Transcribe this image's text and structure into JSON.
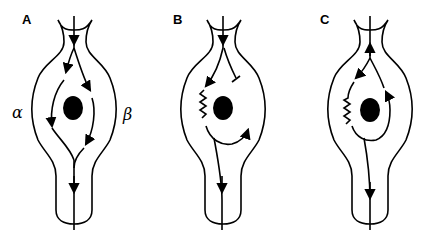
{
  "figure": {
    "panels": [
      {
        "id": "A",
        "label": "A",
        "left_label": "α",
        "right_label": "β"
      },
      {
        "id": "B",
        "label": "B"
      },
      {
        "id": "C",
        "label": "C"
      }
    ],
    "colors": {
      "ink": "#000000",
      "background": "#ffffff"
    }
  }
}
